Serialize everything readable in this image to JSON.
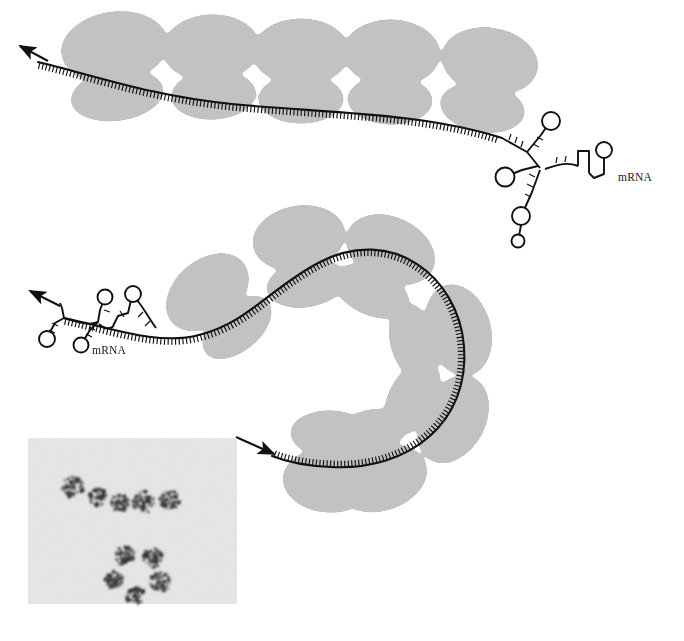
{
  "figure": {
    "background_color": "#ffffff"
  },
  "colors": {
    "ribosome_fill": "#c2c2c2",
    "mrna_stroke": "#111111",
    "arrow_stroke": "#111111",
    "micrograph_background": "#ececec",
    "micrograph_particle": "#2e2e2e",
    "label_text": "#1a1a1a"
  },
  "labels": {
    "top_mrna": "mRNA",
    "bottom_mrna": "mRNA"
  },
  "polysomes": [
    {
      "id": "top-polysome",
      "name": "upper-polyribosome",
      "ribosome_count": 5,
      "direction_arrow": "up-left",
      "mrna_label": "mRNA",
      "ribosomes": [
        {
          "index": 1,
          "cx": 117,
          "cy": 65,
          "large_rx": 53,
          "large_ry": 35,
          "small_rx": 46,
          "small_ry": 25,
          "rotate": -8
        },
        {
          "index": 2,
          "cx": 210,
          "cy": 68,
          "large_rx": 48,
          "large_ry": 33,
          "small_rx": 42,
          "small_ry": 24,
          "rotate": -3
        },
        {
          "index": 3,
          "cx": 300,
          "cy": 72,
          "large_rx": 48,
          "large_ry": 33,
          "small_rx": 42,
          "small_ry": 24,
          "rotate": 0
        },
        {
          "index": 4,
          "cx": 390,
          "cy": 72,
          "large_rx": 48,
          "large_ry": 33,
          "small_rx": 42,
          "small_ry": 24,
          "rotate": 2
        },
        {
          "index": 5,
          "cx": 485,
          "cy": 78,
          "large_rx": 48,
          "large_ry": 33,
          "small_rx": 42,
          "small_ry": 24,
          "rotate": 8
        }
      ],
      "mrna_path": "M 38 62 C 90 74, 150 96, 230 104 C 320 113, 420 112, 500 136",
      "arrow": {
        "x1": 46,
        "y1": 60,
        "x2": 20,
        "y2": 46
      },
      "label_position": {
        "x": 620,
        "y": 180
      }
    },
    {
      "id": "bottom-polysome",
      "name": "lower-polyribosome",
      "ribosome_count": 7,
      "direction_arrow": "left-and-right",
      "mrna_label": "mRNA",
      "ribosomes": [
        {
          "index": 1,
          "cx": 217,
          "cy": 310,
          "large_rx": 46,
          "large_ry": 32,
          "small_rx": 40,
          "small_ry": 23,
          "rotate": -42
        },
        {
          "index": 2,
          "cx": 300,
          "cy": 258,
          "large_rx": 46,
          "large_ry": 32,
          "small_rx": 40,
          "small_ry": 23,
          "rotate": -12
        },
        {
          "index": 3,
          "cx": 381,
          "cy": 268,
          "large_rx": 46,
          "large_ry": 32,
          "small_rx": 40,
          "small_ry": 23,
          "rotate": 22
        },
        {
          "index": 4,
          "cx": 437,
          "cy": 337,
          "large_rx": 46,
          "large_ry": 32,
          "small_rx": 40,
          "small_ry": 23,
          "rotate": 72
        },
        {
          "index": 5,
          "cx": 437,
          "cy": 412,
          "large_rx": 46,
          "large_ry": 32,
          "small_rx": 40,
          "small_ry": 23,
          "rotate": 115
        },
        {
          "index": 6,
          "cx": 378,
          "cy": 462,
          "large_rx": 46,
          "large_ry": 32,
          "small_rx": 40,
          "small_ry": 23,
          "rotate": 160
        },
        {
          "index": 7,
          "cx": 330,
          "cy": 463,
          "large_rx": 46,
          "large_ry": 32,
          "small_rx": 40,
          "small_ry": 23,
          "rotate": 182
        }
      ],
      "mrna_path": "M 64 318 C 110 326, 160 344, 200 334 C 250 322, 270 288, 320 262 C 390 226, 455 274, 462 345 C 469 420, 410 470, 330 466 C 305 465, 285 461, 272 455",
      "arrow_left": {
        "x1": 58,
        "y1": 305,
        "x2": 30,
        "y2": 291
      },
      "arrow_right": {
        "x1": 236,
        "y1": 437,
        "x2": 272,
        "y2": 452
      },
      "label_position": {
        "x": 95,
        "y": 352
      }
    }
  ],
  "mrna_structures": [
    {
      "id": "top-mrna-secondary-structure",
      "name": "mrna-stem-loops-top",
      "hairpin_count": 5,
      "anchor": {
        "x": 500,
        "y": 136
      }
    },
    {
      "id": "bottom-mrna-secondary-structure",
      "name": "mrna-stem-loops-bottom",
      "hairpin_count": 3,
      "anchor": {
        "x": 64,
        "y": 318
      }
    }
  ],
  "micrograph": {
    "name": "electron-micrograph-inset",
    "x": 28,
    "y": 438,
    "width": 209,
    "height": 166,
    "background": "#ececec",
    "groups": [
      {
        "name": "linear-polysome-row",
        "arrangement": "linear",
        "particle_count": 5,
        "particles": [
          {
            "cx": 73,
            "cy": 487,
            "r": 11
          },
          {
            "cx": 98,
            "cy": 497,
            "r": 9
          },
          {
            "cx": 120,
            "cy": 503,
            "r": 9
          },
          {
            "cx": 144,
            "cy": 502,
            "r": 11
          },
          {
            "cx": 170,
            "cy": 500,
            "r": 10
          }
        ]
      },
      {
        "name": "circular-polysome-cluster",
        "arrangement": "circular",
        "particle_count": 5,
        "particles": [
          {
            "cx": 125,
            "cy": 556,
            "r": 10
          },
          {
            "cx": 153,
            "cy": 558,
            "r": 10
          },
          {
            "cx": 114,
            "cy": 580,
            "r": 9
          },
          {
            "cx": 160,
            "cy": 582,
            "r": 10
          },
          {
            "cx": 135,
            "cy": 595,
            "r": 10
          }
        ]
      }
    ]
  }
}
